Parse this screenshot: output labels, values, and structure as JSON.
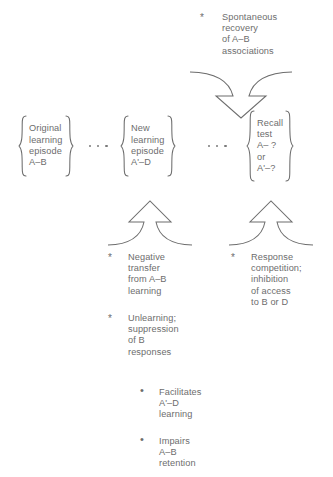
{
  "diagram": {
    "text_color": "#6d6d6d",
    "stroke_color": "#6d6d6d",
    "background": "#ffffff"
  },
  "top_note": {
    "marker": "*",
    "text": "Spontaneous\nrecovery\nof A–B\nassociations"
  },
  "stages": [
    {
      "name": "original-learning-episode",
      "text": "Original\nlearning\nepisode\nA–B"
    },
    {
      "name": "new-learning-episode",
      "text": "New\nlearning\nepisode\nA'–D"
    },
    {
      "name": "recall-test",
      "text": "Recall\ntest\nA– ?\nor\nA'–?"
    }
  ],
  "ellipses": [
    {
      "name": "ellipsis-left",
      "dots": 3
    },
    {
      "name": "ellipsis-right",
      "dots": 3
    }
  ],
  "arrows": [
    {
      "name": "spontaneous-recovery-arrow",
      "direction": "down"
    },
    {
      "name": "negative-transfer-arrow",
      "direction": "up"
    },
    {
      "name": "response-competition-arrow",
      "direction": "up"
    }
  ],
  "left_notes": [
    {
      "marker": "*",
      "text": "Negative\ntransfer\nfrom A–B\nlearning"
    },
    {
      "marker": "*",
      "text": "Unlearning;\nsuppression\nof B\nresponses"
    }
  ],
  "right_notes": [
    {
      "marker": "*",
      "text": "Response\ncompetition;\ninhibition\nof access\nto B or D"
    }
  ],
  "outcomes": [
    {
      "marker": "•",
      "text": "Facilitates\nA'–D\nlearning"
    },
    {
      "marker": "•",
      "text": "Impairs\nA–B\nretention"
    }
  ]
}
